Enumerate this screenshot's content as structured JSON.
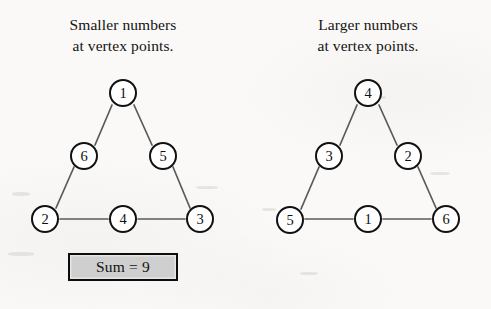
{
  "background_color": "#faf9f7",
  "ink_color": "#111111",
  "sum_box_fill": "#cfcfcf",
  "panels": [
    {
      "id": "smaller-numbers",
      "caption_line1": "Smaller numbers",
      "caption_line2": "at vertex points.",
      "sum_label": "Sum = 9",
      "sum_value": 9,
      "vertex_values": [
        1,
        2,
        3
      ],
      "midpoint_values": [
        6,
        5,
        4
      ],
      "nodes": [
        {
          "label": "1",
          "role": "vertex-top",
          "x": 123,
          "y": 27
        },
        {
          "label": "6",
          "role": "midpoint-left",
          "x": 84,
          "y": 90
        },
        {
          "label": "5",
          "role": "midpoint-right",
          "x": 163,
          "y": 90
        },
        {
          "label": "2",
          "role": "vertex-bottom-left",
          "x": 45,
          "y": 153
        },
        {
          "label": "4",
          "role": "midpoint-bottom",
          "x": 123,
          "y": 153
        },
        {
          "label": "3",
          "role": "vertex-bottom-right",
          "x": 200,
          "y": 153
        }
      ]
    },
    {
      "id": "larger-numbers",
      "caption_line1": "Larger numbers",
      "caption_line2": "at vertex points.",
      "sum_label": "Sum = 12",
      "sum_value": 12,
      "vertex_values": [
        4,
        5,
        6
      ],
      "midpoint_values": [
        3,
        2,
        1
      ],
      "nodes": [
        {
          "label": "4",
          "role": "vertex-top",
          "x": 123,
          "y": 27
        },
        {
          "label": "3",
          "role": "midpoint-left",
          "x": 84,
          "y": 90
        },
        {
          "label": "2",
          "role": "midpoint-right",
          "x": 163,
          "y": 90
        },
        {
          "label": "5",
          "role": "vertex-bottom-left",
          "x": 45,
          "y": 154
        },
        {
          "label": "1",
          "role": "midpoint-bottom",
          "x": 123,
          "y": 153
        },
        {
          "label": "6",
          "role": "vertex-bottom-right",
          "x": 201,
          "y": 153
        }
      ]
    }
  ]
}
